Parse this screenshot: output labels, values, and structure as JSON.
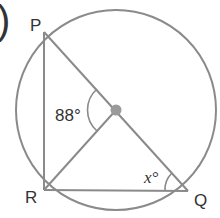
{
  "diagram": {
    "type": "circle-geometry",
    "partial_label": ")",
    "circle": {
      "center": [
        116,
        110
      ],
      "radius": 100,
      "stroke": "#8a8a8a"
    },
    "center_dot": {
      "position": [
        116,
        110
      ],
      "color": "#9a9a9a"
    },
    "points": [
      {
        "name": "P",
        "label": "P",
        "position": [
          44,
          32
        ]
      },
      {
        "name": "R",
        "label": "R",
        "position": [
          44,
          190
        ]
      },
      {
        "name": "Q",
        "label": "Q",
        "position": [
          188,
          191
        ]
      }
    ],
    "segments": [
      {
        "from": "P",
        "to": "Q",
        "passes_through": "center"
      },
      {
        "from": "P",
        "to": "R"
      },
      {
        "from": "R",
        "to": "Q"
      },
      {
        "from": "R",
        "to": "center"
      }
    ],
    "angles": [
      {
        "at": "center",
        "between": [
          "P",
          "R"
        ],
        "label": "88°"
      },
      {
        "at": "Q",
        "between": [
          "P",
          "R"
        ],
        "label": "x°"
      }
    ],
    "line_color": "#8a8a8a",
    "text_color": "#333333"
  }
}
